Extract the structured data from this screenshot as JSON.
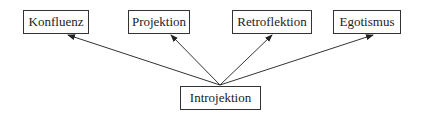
{
  "diagram": {
    "source_node": {
      "id": "introjektion",
      "label": "Introjektion",
      "x": 180,
      "y": 86,
      "w": 81,
      "h": 24
    },
    "target_nodes": [
      {
        "id": "konfluenz",
        "label": "Konfluenz",
        "x": 23,
        "y": 10,
        "w": 66,
        "h": 24
      },
      {
        "id": "projektion",
        "label": "Projektion",
        "x": 128,
        "y": 10,
        "w": 62,
        "h": 24
      },
      {
        "id": "retroflektion",
        "label": "Retroflektion",
        "x": 232,
        "y": 10,
        "w": 80,
        "h": 24
      },
      {
        "id": "egotismus",
        "label": "Egotismus",
        "x": 333,
        "y": 10,
        "w": 68,
        "h": 24
      }
    ],
    "edges": [
      {
        "from": "introjektion",
        "to": "konfluenz"
      },
      {
        "from": "introjektion",
        "to": "projektion"
      },
      {
        "from": "introjektion",
        "to": "retroflektion"
      },
      {
        "from": "introjektion",
        "to": "egotismus"
      }
    ],
    "colors": {
      "line": "#333333",
      "box_border": "#333333",
      "text": "#222222"
    }
  }
}
